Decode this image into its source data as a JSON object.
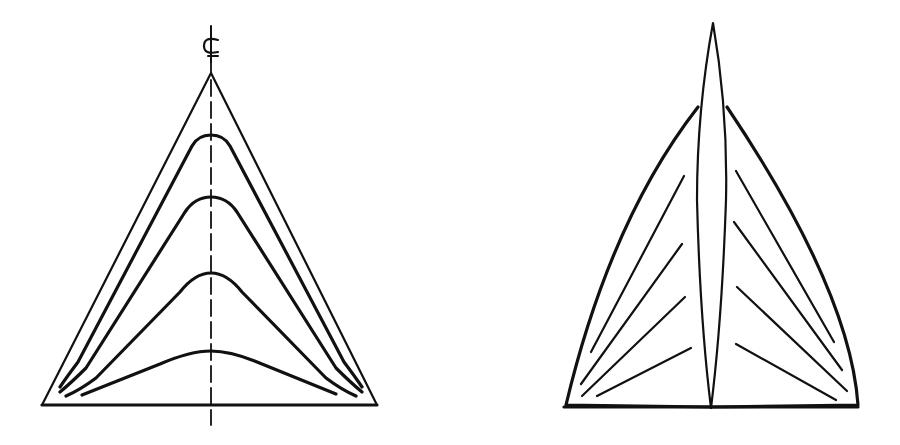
{
  "figure": {
    "left": {
      "centerline_label": "℄",
      "contour_count": 4
    },
    "right": {
      "left_batten_count": 4,
      "right_batten_count": 4
    },
    "colors": {
      "line": "#111111",
      "background": "#ffffff"
    }
  }
}
